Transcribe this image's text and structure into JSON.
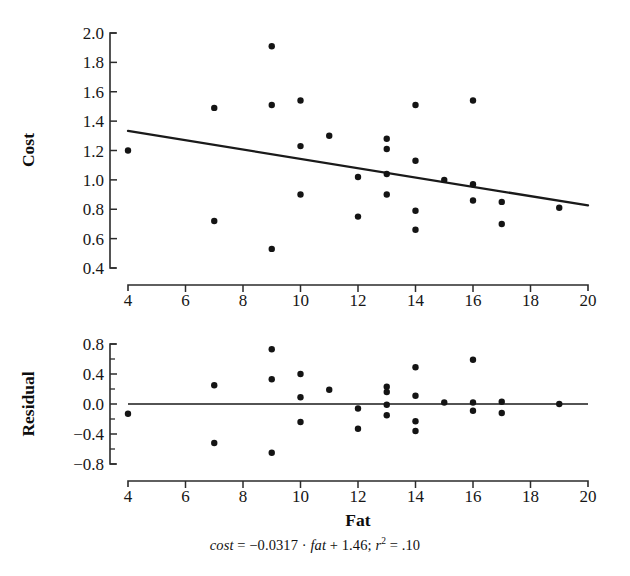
{
  "figure": {
    "caption_parts": {
      "var_y": "cost",
      "eq_mid": " = −0.0317 · ",
      "var_x": "fat",
      "eq_tail": " + 1.46; ",
      "stat_r": "r",
      "stat_sup": "2",
      "stat_tail": " = .10"
    },
    "caption_full": "cost = −0.0317 · fat + 1.46; r2 = .10"
  },
  "chart_data": [
    {
      "id": "cost-vs-fat",
      "type": "scatter",
      "title": "",
      "xlabel": "",
      "ylabel": "Cost",
      "xlim": [
        4,
        20
      ],
      "ylim": [
        0.4,
        2.0
      ],
      "xticks": [
        4,
        6,
        8,
        10,
        12,
        14,
        16,
        18,
        20
      ],
      "xticklabels": [
        "4",
        "6",
        "8",
        "10",
        "12",
        "14",
        "16",
        "18",
        "20"
      ],
      "yticks": [
        0.4,
        0.6,
        0.8,
        1.0,
        1.2,
        1.4,
        1.6,
        1.8,
        2.0
      ],
      "yticklabels": [
        "0.4",
        "0.6",
        "0.8",
        "1.0",
        "1.2",
        "1.4",
        "1.6",
        "1.8",
        "2.0"
      ],
      "grid": false,
      "legend": false,
      "x": [
        4,
        7,
        7,
        9,
        9,
        9,
        10,
        10,
        10,
        11,
        12,
        12,
        13,
        13,
        13,
        13,
        14,
        14,
        14,
        14,
        15,
        16,
        16,
        16,
        17,
        17,
        19
      ],
      "y": [
        1.2,
        1.49,
        0.72,
        1.91,
        1.51,
        0.53,
        1.54,
        1.23,
        0.9,
        1.3,
        1.02,
        0.75,
        1.28,
        1.21,
        1.04,
        0.9,
        1.51,
        1.13,
        0.79,
        0.66,
        1.0,
        1.54,
        0.97,
        0.86,
        0.85,
        0.7,
        0.81
      ],
      "fitline": {
        "slope": -0.0317,
        "intercept": 1.46,
        "x_start": 4,
        "y_start": 1.3332,
        "x_end": 20,
        "y_end": 0.826
      }
    },
    {
      "id": "residual-vs-fat",
      "type": "scatter",
      "title": "",
      "xlabel": "Fat",
      "ylabel": "Residual",
      "xlim": [
        4,
        20
      ],
      "ylim": [
        -0.8,
        0.8
      ],
      "xticks": [
        4,
        6,
        8,
        10,
        12,
        14,
        16,
        18,
        20
      ],
      "xticklabels": [
        "4",
        "6",
        "8",
        "10",
        "12",
        "14",
        "16",
        "18",
        "20"
      ],
      "yticks": [
        -0.8,
        -0.4,
        0.0,
        0.4,
        0.8
      ],
      "yticklabels": [
        "−0.8",
        "−0.4",
        "0.0",
        "0.4",
        "0.8"
      ],
      "yminorticks": [
        -0.6,
        -0.2,
        0.2,
        0.6
      ],
      "grid": false,
      "legend": false,
      "reference_line": 0.0,
      "x": [
        4,
        7,
        7,
        9,
        9,
        9,
        10,
        10,
        10,
        11,
        12,
        12,
        13,
        13,
        13,
        13,
        14,
        14,
        14,
        14,
        15,
        16,
        16,
        16,
        17,
        17,
        19
      ],
      "y": [
        -0.13,
        0.25,
        -0.52,
        0.73,
        0.33,
        -0.65,
        0.4,
        0.09,
        -0.24,
        0.19,
        -0.06,
        -0.33,
        0.23,
        0.16,
        -0.01,
        -0.15,
        0.49,
        0.11,
        -0.23,
        -0.36,
        0.02,
        0.59,
        0.02,
        -0.09,
        0.03,
        -0.12,
        0.0
      ]
    }
  ]
}
